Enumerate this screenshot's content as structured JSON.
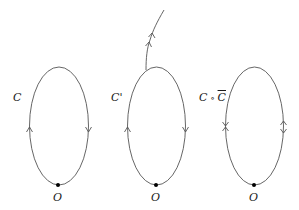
{
  "diagram": {
    "type": "loop-paths",
    "stroke_color": "#555555",
    "point_color": "#000000",
    "panels": [
      {
        "id": "loop-C",
        "label": "C",
        "base_point": "O",
        "arrows": {
          "left": "up",
          "right": "down"
        },
        "has_tail": false
      },
      {
        "id": "loop-C-prime",
        "label": "C'",
        "base_point": "O",
        "arrows": {
          "left": "up",
          "right": "down"
        },
        "has_tail": true,
        "tail_arrows": 2
      },
      {
        "id": "loop-C-compose-Cbar",
        "label_parts": [
          "C",
          " ∘ ",
          "C"
        ],
        "label_overline_index": 2,
        "base_point": "O",
        "arrows": {
          "left": "opposing",
          "right": "opposing"
        },
        "has_tail": false
      }
    ]
  }
}
